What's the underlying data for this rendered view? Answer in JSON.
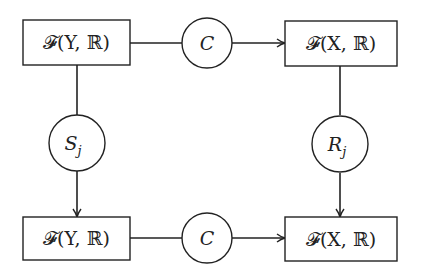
{
  "diagram": {
    "type": "commutative-diagram",
    "nodes": {
      "top_left": {
        "label": "𝓕(Y, ℝ)",
        "shape": "rectangle"
      },
      "top_right": {
        "label": "𝓕(X, ℝ)",
        "shape": "rectangle"
      },
      "bottom_left": {
        "label": "𝓕(Y, ℝ)",
        "shape": "rectangle"
      },
      "bottom_right": {
        "label": "𝓕(X, ℝ)",
        "shape": "rectangle"
      }
    },
    "operators": {
      "top_C": {
        "label": "C",
        "shape": "circle"
      },
      "bottom_C": {
        "label": "C",
        "shape": "circle"
      },
      "S_j": {
        "label": "S",
        "subscript": "j",
        "shape": "circle"
      },
      "R_j": {
        "label": "R",
        "subscript": "j",
        "shape": "circle"
      }
    },
    "edges": [
      {
        "from": "top_left",
        "via": "top_C",
        "to": "top_right",
        "arrow": "end"
      },
      {
        "from": "bottom_left",
        "via": "bottom_C",
        "to": "bottom_right",
        "arrow": "end"
      },
      {
        "from": "top_left",
        "via": "S_j",
        "to": "bottom_left",
        "arrow": "end"
      },
      {
        "from": "top_right",
        "via": "R_j",
        "to": "bottom_right",
        "arrow": "end"
      }
    ],
    "colors": {
      "stroke": "#222222",
      "background": "#ffffff"
    }
  }
}
